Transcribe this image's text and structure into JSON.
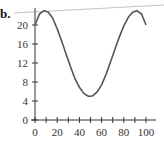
{
  "panel_label": "b.",
  "chart_data": {
    "type": "line",
    "title": "",
    "xlabel": "",
    "ylabel": "",
    "xlim": [
      0,
      100
    ],
    "ylim": [
      0,
      22
    ],
    "x_ticks": [
      0,
      20,
      40,
      60,
      80,
      100
    ],
    "x_tick_labels": [
      "0",
      "20",
      "40",
      "60",
      "80",
      "100"
    ],
    "x_minor_ticks": [
      0,
      10,
      20,
      30,
      40,
      50,
      60,
      70,
      80,
      90,
      100
    ],
    "y_ticks": [
      0,
      4,
      8,
      12,
      16,
      20
    ],
    "y_tick_labels": [
      "0",
      "4",
      "8",
      "12",
      "16",
      "20"
    ],
    "grid": false,
    "legend": null,
    "series": [
      {
        "name": "curve",
        "color": "#555555",
        "x": [
          0,
          4,
          8,
          12,
          16,
          20,
          24,
          28,
          32,
          36,
          40,
          44,
          48,
          50,
          52,
          56,
          60,
          64,
          68,
          72,
          76,
          80,
          84,
          88,
          92,
          96,
          100
        ],
        "y": [
          20.0,
          22.3,
          23.0,
          22.7,
          21.4,
          19.2,
          16.6,
          13.9,
          11.2,
          8.7,
          6.9,
          5.6,
          5.0,
          5.0,
          5.1,
          5.9,
          7.4,
          9.6,
          12.2,
          14.9,
          17.5,
          19.8,
          21.6,
          22.7,
          23.0,
          22.3,
          20.0
        ]
      }
    ]
  },
  "colors": {
    "curve": "#555555",
    "axis": "#333333",
    "overlay_line": "#bbbbbb"
  }
}
